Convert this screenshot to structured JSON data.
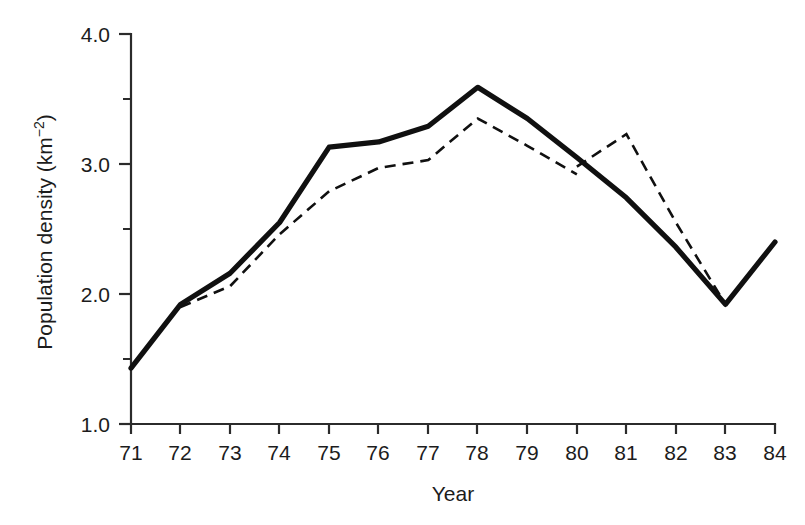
{
  "chart_data": {
    "type": "line",
    "title": "",
    "xlabel": "Year",
    "ylabel": "Population density (km⁻²)",
    "ylabel_base": "Population density (km",
    "ylabel_exponent": "−2",
    "ylabel_close": ")",
    "x": [
      "71",
      "72",
      "73",
      "74",
      "75",
      "76",
      "77",
      "78",
      "79",
      "80",
      "81",
      "82",
      "83",
      "84"
    ],
    "categories": [
      "71",
      "72",
      "73",
      "74",
      "75",
      "76",
      "77",
      "78",
      "79",
      "80",
      "81",
      "82",
      "83",
      "84"
    ],
    "xlim": [
      71,
      84
    ],
    "ylim": [
      1.0,
      4.0
    ],
    "yticks": [
      "1.0",
      "2.0",
      "3.0",
      "4.0"
    ],
    "ytick_values": [
      1.0,
      2.0,
      3.0,
      4.0
    ],
    "yminor_values": [
      1.5,
      2.5,
      3.5
    ],
    "grid": false,
    "legend": "none",
    "line_color": "#101010",
    "axis_color": "#2b2b2b",
    "background": "#ffffff",
    "series": [
      {
        "name": "solid-line",
        "style": "solid",
        "x": [
          "71",
          "72",
          "73",
          "74",
          "75",
          "76",
          "77",
          "78",
          "79",
          "80",
          "81",
          "82",
          "83",
          "84"
        ],
        "values": [
          1.43,
          1.92,
          2.16,
          2.55,
          3.13,
          3.17,
          3.29,
          3.59,
          3.35,
          3.05,
          2.74,
          2.36,
          1.92,
          2.4
        ]
      },
      {
        "name": "dashed-line",
        "style": "dashed",
        "x": [
          "72",
          "73",
          "74",
          "75",
          "76",
          "77",
          "78",
          "79",
          "80"
        ],
        "values": [
          1.9,
          2.06,
          2.46,
          2.79,
          2.97,
          3.03,
          3.35,
          3.14,
          2.92
        ]
      },
      {
        "name": "dashed-line-segment-2",
        "style": "dashed",
        "x": [
          "80",
          "81",
          "82",
          "83"
        ],
        "values": [
          2.98,
          3.23,
          2.55,
          1.92
        ]
      }
    ]
  }
}
